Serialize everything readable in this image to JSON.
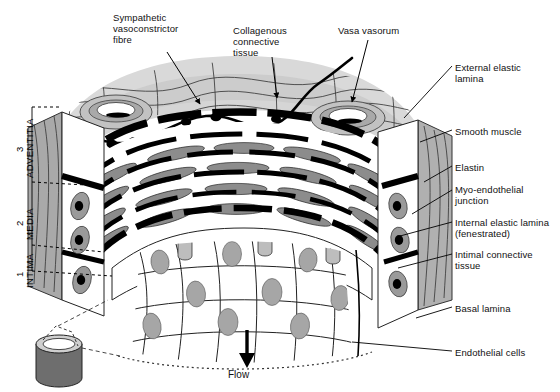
{
  "figure": {
    "background_color": "#ffffff",
    "ink_color": "#000000"
  },
  "palette": {
    "adventitia_fill": "#d8d8d8",
    "adventitia_top": "#c9c9c9",
    "media_fill": "#ffffff",
    "smooth_muscle": "#8f8f8f",
    "elastin": "#000000",
    "nucleus": "#9a9a9a",
    "cut_face": "#a8a8a8",
    "cylinder": "#6e6e6e"
  },
  "layer_brackets": [
    {
      "number": "3",
      "name": "ADVENTITIA",
      "tick_top_y": 107,
      "tick_bottom_y": 182
    },
    {
      "number": "2",
      "name": "MEDIA",
      "tick_top_y": 182,
      "tick_bottom_y": 245
    },
    {
      "number": "1",
      "name": "INTIMA",
      "tick_top_y": 245,
      "tick_bottom_y": 271
    }
  ],
  "top_labels": [
    {
      "id": "sympathetic-vasoconstrictor-fibre",
      "text": "Sympathetic\nvasoconstrictor\nfibre",
      "x": 113,
      "y": 12
    },
    {
      "id": "collagenous-connective-tissue",
      "text": "Collagenous\nconnective\ntissue",
      "x": 233,
      "y": 25
    },
    {
      "id": "vasa-vasorum",
      "text": "Vasa vasorum",
      "x": 338,
      "y": 25
    }
  ],
  "right_labels": [
    {
      "id": "external-elastic-lamina",
      "text": "External elastic\nlamina",
      "x": 455,
      "y": 62
    },
    {
      "id": "smooth-muscle",
      "text": "Smooth muscle",
      "x": 455,
      "y": 126
    },
    {
      "id": "elastin",
      "text": "Elastin",
      "x": 455,
      "y": 162
    },
    {
      "id": "myo-endothelial-junction",
      "text": "Myo-endothelial\njunction",
      "x": 455,
      "y": 184
    },
    {
      "id": "internal-elastic-lamina",
      "text": "Internal elastic lamina\n(fenestrated)",
      "x": 455,
      "y": 217
    },
    {
      "id": "intimal-connective-tissue",
      "text": "Intimal connective\ntissue",
      "x": 455,
      "y": 249
    },
    {
      "id": "basal-lamina",
      "text": "Basal lamina",
      "x": 455,
      "y": 303
    },
    {
      "id": "endothelial-cells",
      "text": "Endothelial cells",
      "x": 455,
      "y": 347
    }
  ],
  "flow": {
    "label": "Flow",
    "x": 228,
    "y": 369,
    "arrow_x": 247,
    "arrow_top_y": 330,
    "arrow_bottom_y": 362
  },
  "inset": {
    "id": "vessel-segment-cylinder",
    "x": 36,
    "y": 330,
    "width": 46,
    "height": 56
  }
}
